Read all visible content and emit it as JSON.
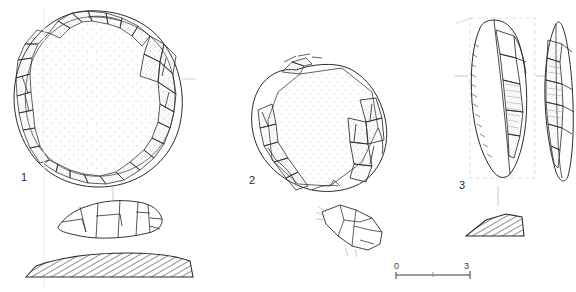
{
  "plate": {
    "title": "Lithic artefact illustration plate",
    "background_color": "#ffffff",
    "ink_color": "#2b2b2b",
    "stipple_color": "#c9c4cf",
    "width": 576,
    "height": 292
  },
  "figures": [
    {
      "id": "figure-1",
      "label": "1",
      "description": "Discoidal core / scraper, plan view with dense marginal retouch, stippled interior, profile view and hatched transverse section",
      "views": [
        "plan",
        "profile",
        "section"
      ],
      "section_fill": "diagonal-hatch",
      "interior_texture": "stipple"
    },
    {
      "id": "figure-2",
      "label": "2",
      "description": "Polygonal flake, plan view with stippled dorsal surface and lateral retouch scars, plus small profile view",
      "views": [
        "plan",
        "profile"
      ],
      "section_fill": "none",
      "interior_texture": "stipple"
    },
    {
      "id": "figure-3",
      "label": "3",
      "description": "Elongated blade / point, obverse and reverse views within dashed registration frame, with hatched wedge-shaped transverse section",
      "views": [
        "obverse",
        "reverse",
        "section"
      ],
      "section_fill": "diagonal-hatch",
      "interior_texture": "ripple-lines"
    }
  ],
  "scale_bar": {
    "start_label": "0",
    "end_label": "3",
    "units": "cm",
    "tick_count": 2,
    "has_midpoint_tick": true
  }
}
